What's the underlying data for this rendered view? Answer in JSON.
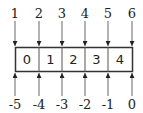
{
  "diagram": {
    "cells": [
      "0",
      "1",
      "2",
      "3",
      "4"
    ],
    "top_indices": [
      "1",
      "2",
      "3",
      "4",
      "5",
      "6"
    ],
    "bottom_indices": [
      "-5",
      "-4",
      "-3",
      "-2",
      "-1",
      "0"
    ],
    "colors": {
      "line": "#555555",
      "box": "#333333",
      "text": "#222222"
    }
  }
}
